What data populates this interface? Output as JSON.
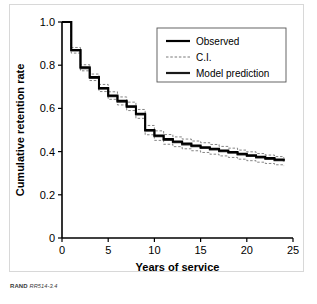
{
  "figure": {
    "credit_mark": "RAND",
    "credit_number": "RR514-3.4"
  },
  "chart_data": {
    "type": "line",
    "subtype": "step-survival-curve",
    "title": "",
    "xlabel": "Years of service",
    "ylabel": "Cumulative retention rate",
    "xlim": [
      0,
      25
    ],
    "ylim": [
      0,
      1.0
    ],
    "xticks": [
      0,
      5,
      10,
      15,
      20,
      25
    ],
    "xtick_labels": [
      "0",
      "5",
      "10",
      "15",
      "20",
      "25"
    ],
    "yticks": [
      0,
      0.2,
      0.4,
      0.6,
      0.8,
      1.0
    ],
    "ytick_labels": [
      "0",
      "0.2",
      "0.4",
      "0.6",
      "0.8",
      "1.0"
    ],
    "grid": false,
    "legend_position": "upper-right",
    "legend_entries": [
      {
        "label": "Observed",
        "style": "solid",
        "width": 2.2,
        "color": "#000000"
      },
      {
        "label": "C.I.",
        "style": "dashed",
        "width": 0.8,
        "color": "#555555"
      },
      {
        "label": "Model prediction",
        "style": "solid",
        "width": 2.2,
        "color": "#1a1a1a"
      }
    ],
    "series": [
      {
        "name": "Observed",
        "style": "step",
        "x": [
          0,
          1,
          2,
          3,
          4,
          5,
          6,
          7,
          8,
          9,
          10,
          11,
          12,
          13,
          14,
          15,
          16,
          17,
          18,
          19,
          20,
          21,
          22,
          23,
          24
        ],
        "values": [
          1.0,
          0.87,
          0.79,
          0.745,
          0.695,
          0.66,
          0.635,
          0.61,
          0.575,
          0.5,
          0.475,
          0.458,
          0.447,
          0.437,
          0.428,
          0.42,
          0.413,
          0.405,
          0.398,
          0.39,
          0.383,
          0.376,
          0.37,
          0.364,
          0.358
        ]
      },
      {
        "name": "Model prediction",
        "style": "step",
        "x": [
          0,
          1,
          2,
          3,
          4,
          5,
          6,
          7,
          8,
          9,
          10,
          11,
          12,
          13,
          14,
          15,
          16,
          17,
          18,
          19,
          20,
          21,
          22,
          23,
          24
        ],
        "values": [
          1.0,
          0.868,
          0.786,
          0.741,
          0.691,
          0.656,
          0.631,
          0.606,
          0.571,
          0.496,
          0.471,
          0.454,
          0.443,
          0.433,
          0.424,
          0.416,
          0.409,
          0.401,
          0.394,
          0.386,
          0.379,
          0.372,
          0.366,
          0.36,
          0.354
        ]
      },
      {
        "name": "C.I. upper",
        "style": "step-dashed",
        "x": [
          0,
          1,
          2,
          3,
          4,
          5,
          6,
          7,
          8,
          9,
          10,
          11,
          12,
          13,
          14,
          15,
          16,
          17,
          18,
          19,
          20,
          21,
          22,
          23,
          24
        ],
        "values": [
          1.0,
          0.882,
          0.802,
          0.759,
          0.711,
          0.677,
          0.653,
          0.629,
          0.595,
          0.521,
          0.496,
          0.479,
          0.468,
          0.458,
          0.449,
          0.441,
          0.433,
          0.424,
          0.416,
          0.407,
          0.399,
          0.391,
          0.384,
          0.377,
          0.37
        ]
      },
      {
        "name": "C.I. lower",
        "style": "step-dashed",
        "x": [
          0,
          1,
          2,
          3,
          4,
          5,
          6,
          7,
          8,
          9,
          10,
          11,
          12,
          13,
          14,
          15,
          16,
          17,
          18,
          19,
          20,
          21,
          22,
          23,
          24
        ],
        "values": [
          1.0,
          0.856,
          0.774,
          0.729,
          0.678,
          0.642,
          0.616,
          0.59,
          0.554,
          0.478,
          0.452,
          0.434,
          0.423,
          0.413,
          0.404,
          0.396,
          0.388,
          0.38,
          0.373,
          0.365,
          0.358,
          0.351,
          0.345,
          0.339,
          0.333
        ]
      }
    ]
  }
}
